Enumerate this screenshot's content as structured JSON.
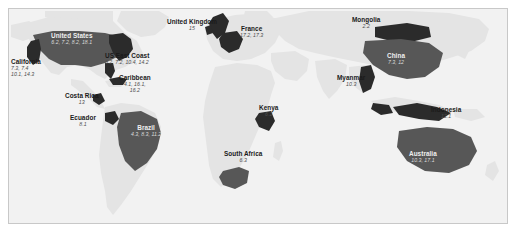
{
  "figure": {
    "type": "map",
    "projection": "world-equirectangular",
    "background_color": "#f2f2f2",
    "land_color": "#e4e4e4",
    "highlight_color": "#2b2b2b",
    "mid_color": "#575757",
    "border_color": "#c8c8c8",
    "label_color": "#1a1a1a",
    "value_color": "#4d4d4d"
  },
  "labels": [
    {
      "id": "united-states",
      "name": "United States",
      "values": "6.2, 7.2, 8.2, 18.1",
      "x": 42,
      "y": 24,
      "on_fill": true,
      "align": "center"
    },
    {
      "id": "california",
      "name": "California",
      "values": "7.3, 7.4",
      "values2": "10.1, 14.3",
      "x": 2,
      "y": 50,
      "on_fill": false,
      "align": "left"
    },
    {
      "id": "us-east-coast",
      "name": "US East Coast",
      "values": "6.2, 7.2, 10.4, 14.2",
      "x": 96,
      "y": 44,
      "on_fill": false,
      "align": "left"
    },
    {
      "id": "caribbean",
      "name": "Caribbean",
      "values": "4.1, 16.1,",
      "values2": "16.2",
      "x": 110,
      "y": 66,
      "on_fill": false,
      "align": "center"
    },
    {
      "id": "costa-rica",
      "name": "Costa Rica",
      "values": "13",
      "x": 56,
      "y": 84,
      "on_fill": false,
      "align": "center"
    },
    {
      "id": "ecuador",
      "name": "Ecuador",
      "values": "8.1",
      "x": 61,
      "y": 106,
      "on_fill": false,
      "align": "center"
    },
    {
      "id": "brazil",
      "name": "Brazil",
      "values": "4.3, 8.3, 11.2",
      "x": 122,
      "y": 116,
      "on_fill": true,
      "align": "center"
    },
    {
      "id": "united-kingdom",
      "name": "United Kingdom",
      "values": "15",
      "x": 158,
      "y": 10,
      "on_fill": false,
      "align": "center"
    },
    {
      "id": "france",
      "name": "France",
      "values": "17.2, 17.3",
      "x": 231,
      "y": 17,
      "on_fill": false,
      "align": "center"
    },
    {
      "id": "kenya",
      "name": "Kenya",
      "values": "6.2",
      "x": 250,
      "y": 96,
      "on_fill": false,
      "align": "center"
    },
    {
      "id": "south-africa",
      "name": "South Africa",
      "values": "6.3",
      "x": 215,
      "y": 142,
      "on_fill": false,
      "align": "center"
    },
    {
      "id": "mongolia",
      "name": "Mongolia",
      "values": "2.2",
      "x": 343,
      "y": 8,
      "on_fill": false,
      "align": "center"
    },
    {
      "id": "china",
      "name": "China",
      "values": "7.3, 12",
      "x": 378,
      "y": 44,
      "on_fill": true,
      "align": "center"
    },
    {
      "id": "myanmar",
      "name": "Myanmar",
      "values": "10.3",
      "x": 328,
      "y": 66,
      "on_fill": false,
      "align": "center"
    },
    {
      "id": "indonesia",
      "name": "Indonesia",
      "values": "12.1",
      "x": 422,
      "y": 98,
      "on_fill": false,
      "align": "center"
    },
    {
      "id": "australia",
      "name": "Australia",
      "values": "10.3, 17.1",
      "x": 400,
      "y": 142,
      "on_fill": true,
      "align": "center"
    }
  ]
}
